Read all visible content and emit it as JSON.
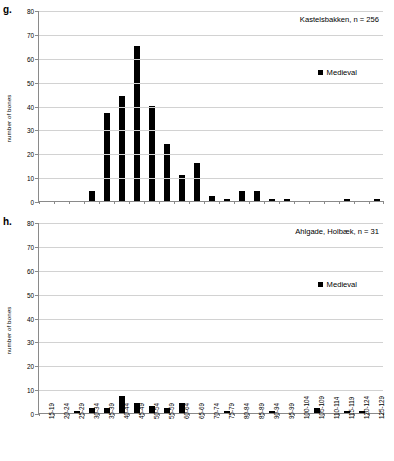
{
  "figure": {
    "panels": [
      {
        "letter": "g.",
        "annotation": "Kastelsbakken, n = 256",
        "legend_label": "Medieval"
      },
      {
        "letter": "h.",
        "annotation": "Ahlgade, Holbæk, n = 31",
        "legend_label": "Medieval"
      }
    ],
    "series_color": "#000000",
    "grid_color": "#d2d2d2",
    "axis_color": "#8a8a8a"
  },
  "chart_data": [
    {
      "type": "bar",
      "panel": "g.",
      "title": "Kastelsbakken, n = 256",
      "xlabel": "",
      "ylabel": "number of bones",
      "ylim": [
        0,
        80
      ],
      "yticks": [
        0,
        10,
        20,
        30,
        40,
        50,
        60,
        70,
        80
      ],
      "grid": true,
      "legend_position": "inside-right",
      "categories": [
        "15-19",
        "20-24",
        "25-29",
        "30-34",
        "35-39",
        "40-44",
        "45-49",
        "50-54",
        "55-59",
        "60-64",
        "65-69",
        "70-74",
        "75-79",
        "80-84",
        "85-89",
        "90-94",
        "95-99",
        "100-104",
        "105-109",
        "110-114",
        "115-119",
        "120-124",
        "125-129"
      ],
      "series": [
        {
          "name": "Medieval",
          "values": [
            0,
            0,
            0,
            4,
            37,
            44,
            65,
            40,
            24,
            11,
            16,
            2,
            1,
            4,
            4,
            1,
            1,
            0,
            0,
            0,
            1,
            0,
            1
          ]
        }
      ]
    },
    {
      "type": "bar",
      "panel": "h.",
      "title": "Ahlgade, Holbæk, n = 31",
      "xlabel": "total length (cm)",
      "ylabel": "number of bones",
      "ylim": [
        0,
        80
      ],
      "yticks": [
        0,
        10,
        20,
        30,
        40,
        50,
        60,
        70,
        80
      ],
      "grid": true,
      "legend_position": "inside-right",
      "categories": [
        "15-19",
        "20-24",
        "25-29",
        "30-34",
        "35-39",
        "40-44",
        "45-49",
        "50-54",
        "55-59",
        "60-64",
        "65-69",
        "70-74",
        "75-79",
        "80-84",
        "85-89",
        "90-94",
        "95-99",
        "100-104",
        "105-109",
        "110-114",
        "115-119",
        "120-124",
        "125-129"
      ],
      "series": [
        {
          "name": "Medieval",
          "values": [
            0,
            0,
            1,
            2,
            2,
            7,
            4,
            3,
            2,
            4,
            0,
            0,
            1,
            0,
            0,
            1,
            0,
            0,
            2,
            0,
            1,
            1,
            0
          ]
        }
      ]
    }
  ]
}
